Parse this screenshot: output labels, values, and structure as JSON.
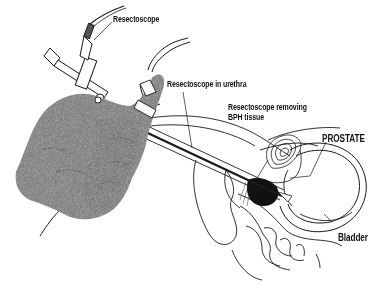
{
  "figure": {
    "labels": {
      "resectoscope": "Resectoscope",
      "resectoscope_in_urethra": "Resectoscope in urethra",
      "resectoscope_removing_line1": "Resectoscope removing",
      "resectoscope_removing_line2": "BPH tissue",
      "prostate": "PROSTATE",
      "bladder": "Bladder"
    },
    "colors": {
      "background": "#ffffff",
      "line": "#1a1a1a",
      "glove": "#6e6e6e",
      "tissue": "#111111"
    }
  }
}
